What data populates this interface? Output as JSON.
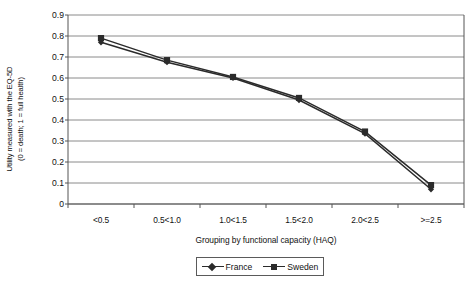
{
  "chart_data": {
    "type": "line",
    "title": "",
    "xlabel": "Grouping by functional capacity (HAQ)",
    "ylabel": "Utility measured with the EQ-5D (0 = death; 1 = full health)",
    "ylabel_line1": "Utility measured with the EQ-5D",
    "ylabel_line2": "(0 = death; 1 = full health)",
    "categories": [
      "<0.5",
      "0.5<1.0",
      "1.0<1.5",
      "1.5<2.0",
      "2.0<2.5",
      ">=2.5"
    ],
    "ylim": [
      0,
      0.9
    ],
    "ytick_labels": [
      "0.9",
      "0.8",
      "0.7",
      "0.6",
      "0.5",
      "0.4",
      "0.3",
      "0.2",
      "0.1",
      "0"
    ],
    "ytick_values": [
      0.9,
      0.8,
      0.7,
      0.6,
      0.5,
      0.4,
      0.3,
      0.2,
      0.1,
      0
    ],
    "grid": "horizontal",
    "legend_position": "bottom",
    "series": [
      {
        "name": "France",
        "marker": "diamond",
        "color": "#2b2b2b",
        "values": [
          0.77,
          0.675,
          0.6,
          0.495,
          0.335,
          0.07
        ]
      },
      {
        "name": "Sweden",
        "marker": "square",
        "color": "#2b2b2b",
        "values": [
          0.79,
          0.685,
          0.605,
          0.505,
          0.345,
          0.09
        ]
      }
    ]
  },
  "legend": {
    "entries": [
      {
        "label": "France",
        "marker": "diamond-marker-icon"
      },
      {
        "label": "Sweden",
        "marker": "square-marker-icon"
      }
    ]
  },
  "colors": {
    "series_line": "#2b2b2b",
    "grid_line": "#8a8a8a",
    "axis_line": "#555555",
    "plot_background": "#ffffff",
    "text": "#111111"
  }
}
